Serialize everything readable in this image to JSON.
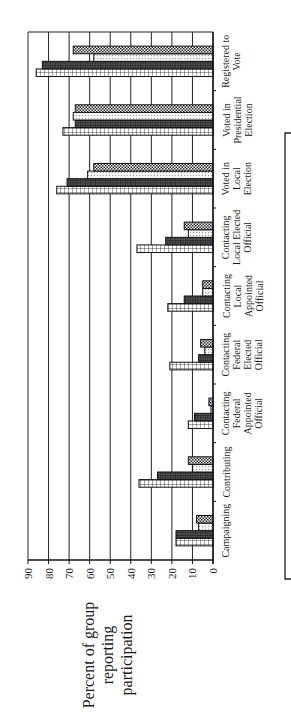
{
  "chart_data": {
    "type": "bar",
    "orientation": "rotated-90-ccw",
    "title": "",
    "xlabel": "",
    "ylabel": "Percent of group reporting participation",
    "ylabel_lines": [
      "Percent of group",
      "reporting",
      "participation"
    ],
    "ylim": [
      0,
      90
    ],
    "yticks": [
      0,
      10,
      20,
      30,
      40,
      50,
      60,
      70,
      80,
      90
    ],
    "grid": true,
    "legend_position": "right (box, labels not visible)",
    "categories": [
      "Campaigning",
      "Contributing",
      "Contacting Federal Appointed Official",
      "Contacting Federal Elected Official",
      "Contacting Local Appointed Official",
      "Contacting Local Elected Official",
      "Voted in Local Election",
      "Voted in Presidential Election",
      "Registered to Vote"
    ],
    "category_label_lines": [
      [
        "Campaigning"
      ],
      [
        "Contributing"
      ],
      [
        "Contacting",
        "Federal",
        "Appointed",
        "Official"
      ],
      [
        "Contacting",
        "Federal",
        "Elected",
        "Official"
      ],
      [
        "Contacting",
        "Local",
        "Appointed",
        "Official"
      ],
      [
        "Contacting",
        "Local Elected",
        "Official"
      ],
      [
        "Voted in",
        "Local",
        "Election"
      ],
      [
        "Voted in",
        "Presidential",
        "Election"
      ],
      [
        "Registered to",
        "Vote"
      ]
    ],
    "series": [
      {
        "name": "Series 1 (light grid pattern)",
        "pattern": "light-grid",
        "values": [
          18,
          36,
          12,
          21,
          22,
          37,
          76,
          73,
          86
        ]
      },
      {
        "name": "Series 2 (dark grid pattern)",
        "pattern": "dark-grid",
        "values": [
          18,
          27,
          9,
          7,
          14,
          23,
          71,
          67,
          83
        ]
      },
      {
        "name": "Series 3 (dotted pattern)",
        "pattern": "dotted",
        "values": [
          7,
          10,
          1,
          4,
          5,
          12,
          61,
          68,
          58
        ]
      },
      {
        "name": "Series 4 (checker pattern)",
        "pattern": "checker",
        "values": [
          8,
          12,
          2,
          6,
          5,
          14,
          58,
          67,
          68
        ]
      }
    ]
  }
}
